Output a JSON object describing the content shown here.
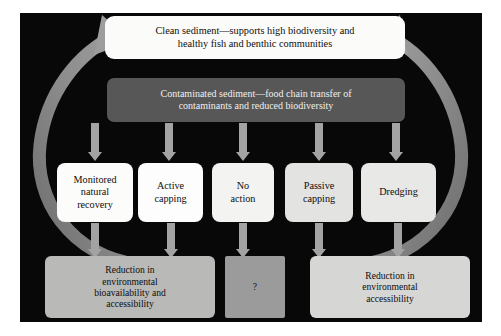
{
  "figure": {
    "background_color": "#080808",
    "page_background": "#ffffff"
  },
  "nodes": {
    "clean_sediment": {
      "line1": "Clean sediment—supports high biodiversity and",
      "line2": "healthy fish and benthic communities",
      "fill": "#fbfbfa",
      "text_color": "#0d0d0d"
    },
    "contaminated_sediment": {
      "line1": "Contaminated sediment—food chain transfer of",
      "line2": "contaminants and reduced biodiversity",
      "fill": "#575757",
      "text_color": "#efefef"
    }
  },
  "options": [
    {
      "id": "monitored-natural-recovery",
      "lines": [
        "Monitored",
        "natural",
        "recovery"
      ],
      "fill": "#fcfcfb"
    },
    {
      "id": "active-capping",
      "lines": [
        "Active",
        "capping"
      ],
      "fill": "#fdfdfd"
    },
    {
      "id": "no-action",
      "lines": [
        "No",
        "action"
      ],
      "fill": "#f3f3f2"
    },
    {
      "id": "passive-capping",
      "lines": [
        "Passive",
        "capping"
      ],
      "fill": "#e3e3e2"
    },
    {
      "id": "dredging",
      "lines": [
        "Dredging"
      ],
      "fill": "#e8e8e7"
    }
  ],
  "outcomes": [
    {
      "id": "reduction-bioavailability",
      "lines": [
        "Reduction in",
        "environmental",
        "bioavailability and",
        "accessibility"
      ],
      "fill": "#b9b9b8"
    },
    {
      "id": "unknown-outcome",
      "lines": [
        "?"
      ],
      "fill": "#9b9b9b"
    },
    {
      "id": "reduction-accessibility",
      "lines": [
        "Reduction in",
        "environmental",
        "accessibility"
      ],
      "fill": "#d6d6d5"
    }
  ],
  "connectors": {
    "color": "#a3a3a3",
    "from_contaminated_count": 5,
    "to_outcome_count": 5
  },
  "cycle_arrows": {
    "color": "#8a8a8a",
    "left_label": "left-recycle-arrow",
    "right_label": "right-recycle-arrow"
  }
}
